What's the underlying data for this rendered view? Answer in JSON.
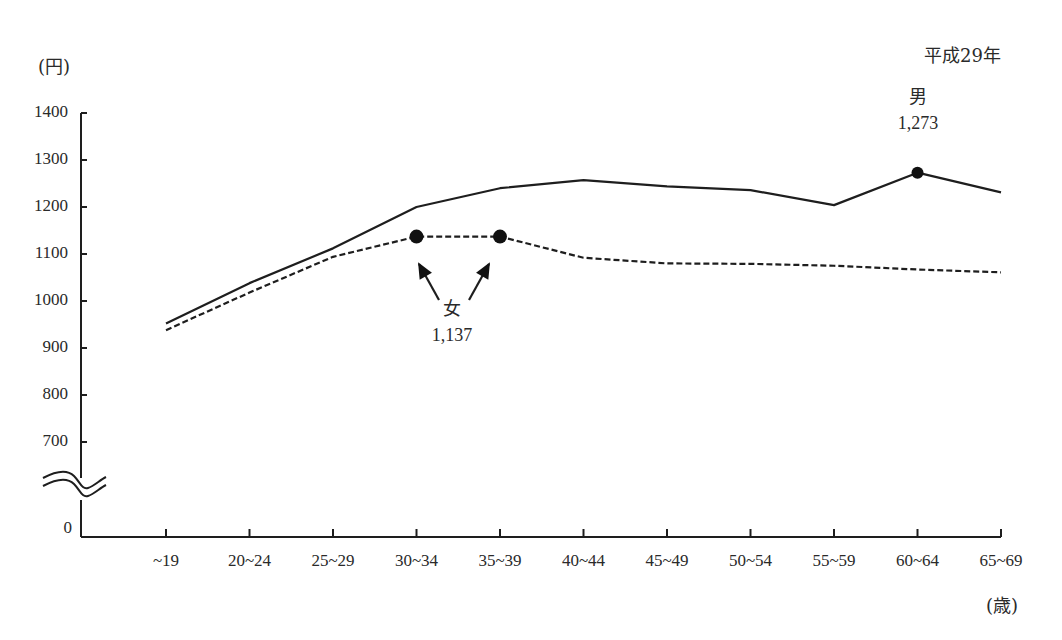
{
  "chart_data": {
    "type": "line",
    "title": "",
    "subtitle": "平成29年",
    "ylabel": "(円)",
    "xlabel": "(歳)",
    "categories": [
      "~19",
      "20~24",
      "25~29",
      "30~34",
      "35~39",
      "40~44",
      "45~49",
      "50~54",
      "55~59",
      "60~64",
      "65~69"
    ],
    "yticks": [
      0,
      700,
      800,
      900,
      1000,
      1100,
      1200,
      1300,
      1400
    ],
    "ylim": [
      0,
      1400
    ],
    "axis_break": "between 0 and 700",
    "grid": false,
    "legend": "none (series labeled by annotations)",
    "series": [
      {
        "name": "男",
        "style": "solid",
        "values": [
          952,
          1038,
          1112,
          1200,
          1240,
          1257,
          1244,
          1236,
          1204,
          1273,
          1231
        ]
      },
      {
        "name": "女",
        "style": "dashed",
        "values": [
          938,
          1018,
          1094,
          1137,
          1137,
          1092,
          1080,
          1079,
          1075,
          1067,
          1061
        ]
      }
    ],
    "annotations": [
      {
        "series": "男",
        "label": "男",
        "value_text": "1,273",
        "category": "60~64",
        "marker": true
      },
      {
        "series": "女",
        "label": "女",
        "value_text": "1,137",
        "categories": [
          "30~34",
          "35~39"
        ],
        "marker": true,
        "arrows": 2
      }
    ]
  },
  "labels": {
    "year": "平成29年",
    "y_unit": "(円)",
    "x_unit": "(歳)",
    "male_label": "男",
    "male_value": "1,273",
    "female_label": "女",
    "female_value": "1,137",
    "zero": "0"
  }
}
